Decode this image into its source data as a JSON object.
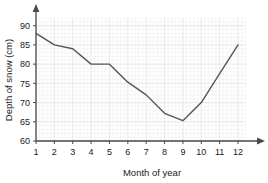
{
  "chart_data": {
    "type": "line",
    "title": "",
    "xlabel": "Month of year",
    "ylabel": "Depth of snow (cm)",
    "x": [
      1,
      2,
      3,
      4,
      5,
      6,
      7,
      8,
      9,
      10,
      11,
      12
    ],
    "categories": [
      "1",
      "2",
      "3",
      "4",
      "5",
      "6",
      "7",
      "8",
      "9",
      "10",
      "11",
      "12"
    ],
    "values": [
      88,
      85,
      84,
      80,
      80,
      75.3,
      72,
      67.2,
      65.3,
      70,
      77.5,
      85
    ],
    "xlim": [
      1,
      12
    ],
    "ylim": [
      60,
      92
    ],
    "xticks": [
      "1",
      "2",
      "3",
      "4",
      "5",
      "6",
      "7",
      "8",
      "9",
      "10",
      "11",
      "12"
    ],
    "yticks": [
      "60",
      "65",
      "70",
      "75",
      "80",
      "85",
      "90"
    ],
    "ytick_values": [
      60,
      65,
      70,
      75,
      80,
      85,
      90
    ],
    "grid": true,
    "grid_minor": true,
    "legend": false,
    "line_color": "#555558",
    "axis_color": "#4a4a4a",
    "grid_color": "#ececf0",
    "background": "#ffffff",
    "axis_arrows": true
  }
}
